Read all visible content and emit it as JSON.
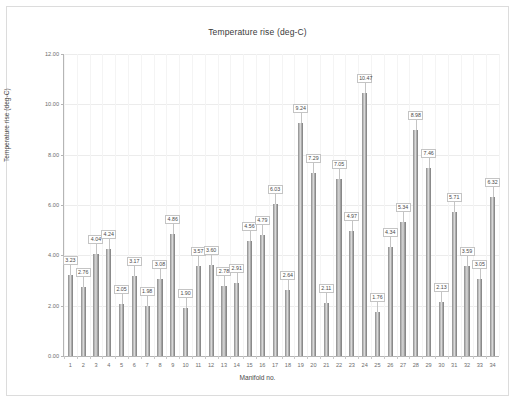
{
  "chart_data": {
    "type": "bar",
    "title": "Temperature rise (deg-C)",
    "xlabel": "Manifold no.",
    "ylabel": "Temperature rise (deg-C)",
    "ylim": [
      0,
      12
    ],
    "ytick_labels": [
      "0.00",
      "2.00",
      "4.00",
      "6.00",
      "8.00",
      "10.00",
      "12.00"
    ],
    "ytick_values": [
      0,
      2,
      4,
      6,
      8,
      10,
      12
    ],
    "grid": "horizontal-and-vertical-faint",
    "legend": "none",
    "categories": [
      "1",
      "2",
      "3",
      "4",
      "5",
      "6",
      "7",
      "8",
      "9",
      "10",
      "11",
      "12",
      "13",
      "14",
      "15",
      "16",
      "17",
      "18",
      "19",
      "20",
      "21",
      "22",
      "23",
      "24",
      "25",
      "26",
      "27",
      "28",
      "29",
      "30",
      "31",
      "32",
      "33",
      "34"
    ],
    "values": [
      3.23,
      2.76,
      4.04,
      4.24,
      2.05,
      3.17,
      1.98,
      3.08,
      4.86,
      1.9,
      3.57,
      3.6,
      2.78,
      2.91,
      4.56,
      4.79,
      6.03,
      2.64,
      9.24,
      7.29,
      2.11,
      7.05,
      4.97,
      10.47,
      1.76,
      4.34,
      5.34,
      8.98,
      7.46,
      2.13,
      5.71,
      3.59,
      3.05,
      6.32
    ],
    "data_labels": [
      "3.23",
      "2.76",
      "4.04",
      "4.24",
      "2.05",
      "3.17",
      "1.98",
      "3.08",
      "4.86",
      "1.90",
      "3.57",
      "3.60",
      "2.78",
      "2.91",
      "4.56",
      "4.79",
      "6.03",
      "2.64",
      "9.24",
      "7.29",
      "2.11",
      "7.05",
      "4.97",
      "10.47",
      "1.76",
      "4.34",
      "5.34",
      "8.98",
      "7.46",
      "2.13",
      "5.71",
      "3.59",
      "3.05",
      "6.32"
    ],
    "bar_color": "#9a9a9a",
    "label_border_color": "#c4c4c4",
    "axis_color": "#b5b5b5",
    "grid_color": "#ececec"
  }
}
